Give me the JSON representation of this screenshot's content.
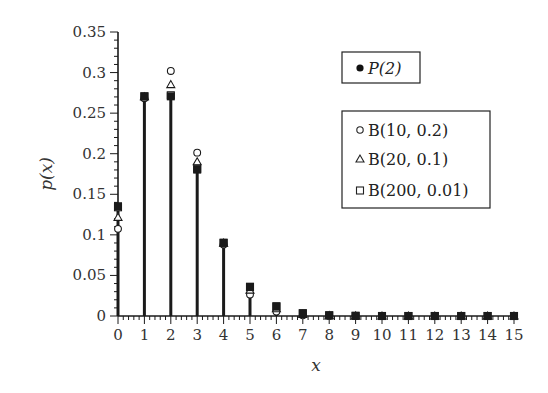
{
  "chart_data": {
    "type": "scatter",
    "subtype": "stem",
    "title": "",
    "xlabel": "x",
    "ylabel": "p(x)",
    "xlim": [
      0,
      15
    ],
    "ylim": [
      0,
      0.35
    ],
    "x_ticks": [
      "0",
      "1",
      "2",
      "3",
      "4",
      "5",
      "6",
      "7",
      "8",
      "9",
      "10",
      "11",
      "12",
      "13",
      "14",
      "15"
    ],
    "y_ticks": [
      "0",
      "0.05",
      "0.1",
      "0.15",
      "0.2",
      "0.25",
      "0.3",
      "0.35"
    ],
    "grid": false,
    "x": [
      0,
      1,
      2,
      3,
      4,
      5,
      6,
      7,
      8,
      9,
      10,
      11,
      12,
      13,
      14,
      15
    ],
    "series": [
      {
        "name": "P(2)",
        "marker": "filled-square-stem",
        "legend_marker": "filled-circle",
        "values": [
          0.1353,
          0.2707,
          0.2707,
          0.1804,
          0.0902,
          0.0361,
          0.012,
          0.0034,
          0.0009,
          0.0002,
          0.0,
          0.0,
          0.0,
          0.0,
          0.0,
          0.0
        ]
      },
      {
        "name": "B(10, 0.2)",
        "marker": "open-circle",
        "values": [
          0.1074,
          0.2684,
          0.302,
          0.2013,
          0.0881,
          0.0264,
          0.0055,
          0.0008,
          0.0001,
          0.0,
          0.0,
          null,
          null,
          null,
          null,
          null
        ]
      },
      {
        "name": "B(20, 0.1)",
        "marker": "open-triangle",
        "values": [
          0.1216,
          0.2702,
          0.2852,
          0.1901,
          0.0898,
          0.0319,
          0.0089,
          0.002,
          0.0004,
          0.0001,
          0.0,
          0.0,
          0.0,
          0.0,
          0.0,
          0.0
        ]
      },
      {
        "name": "B(200, 0.01)",
        "marker": "open-square",
        "values": [
          0.134,
          0.2707,
          0.272,
          0.1814,
          0.0902,
          0.0357,
          0.0117,
          0.0033,
          0.0008,
          0.0002,
          0.0,
          0.0,
          0.0,
          0.0,
          0.0,
          0.0
        ]
      }
    ],
    "legend": [
      {
        "box": 1,
        "entries": [
          "P(2)"
        ]
      },
      {
        "box": 2,
        "entries": [
          "B(10, 0.2)",
          "B(20, 0.1)",
          "B(200, 0.01)"
        ]
      }
    ],
    "legend_position": "upper right"
  },
  "legend": {
    "box1": [
      {
        "symbol": "●",
        "label": "P(2)"
      }
    ],
    "box2": [
      {
        "symbol": "○",
        "label": "B(10, 0.2)"
      },
      {
        "symbol": "△",
        "label": "B(20, 0.1)"
      },
      {
        "symbol": "□",
        "label": "B(200, 0.01)"
      }
    ]
  },
  "axes": {
    "xlabel": "x",
    "ylabel": "p(x)"
  },
  "colors": {
    "ink": "#1a1a1a",
    "text": "#333333",
    "background": "#ffffff"
  }
}
